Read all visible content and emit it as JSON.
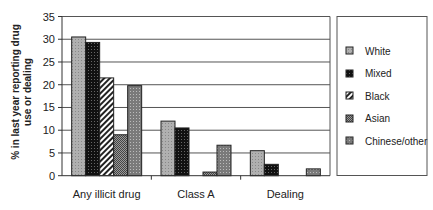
{
  "chart_data": {
    "type": "bar",
    "title": "",
    "xlabel": "",
    "ylabel": "% in last year reporting drug use or dealing",
    "ylabel_lines": [
      "% in last year reporting drug",
      "use or dealing"
    ],
    "ylim": [
      0,
      35
    ],
    "yticks": [
      0,
      5,
      10,
      15,
      20,
      25,
      30,
      35
    ],
    "grid": true,
    "legend_position": "right",
    "categories": [
      "Any illicit drug",
      "Class A",
      "Dealing"
    ],
    "series": [
      {
        "name": "White",
        "values": [
          30.5,
          12.0,
          5.5
        ],
        "fill": "#a8a8a8",
        "pattern": "light-stipple"
      },
      {
        "name": "Mixed",
        "values": [
          29.3,
          10.5,
          2.5
        ],
        "fill": "#111111",
        "pattern": "dark-stipple"
      },
      {
        "name": "Black",
        "values": [
          21.5,
          0,
          0
        ],
        "fill": "#ffffff",
        "pattern": "diagonal-stripes"
      },
      {
        "name": "Asian",
        "values": [
          9.0,
          0.8,
          0
        ],
        "fill": "#777777",
        "pattern": "checker"
      },
      {
        "name": "Chinese/other",
        "values": [
          19.8,
          6.7,
          1.5
        ],
        "fill": "#8a8a8a",
        "pattern": "fine-dots"
      }
    ]
  }
}
